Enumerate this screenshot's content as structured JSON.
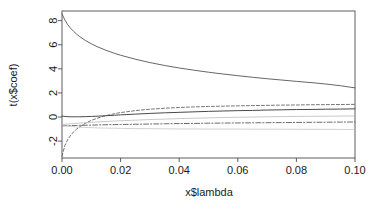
{
  "chart_data": {
    "type": "line",
    "title": "",
    "xlabel": "x$lambda",
    "ylabel": "t(x$coef)",
    "xlim": [
      0.0,
      0.1
    ],
    "ylim": [
      -3.4,
      8.8
    ],
    "grid": false,
    "legend": "none",
    "xticks": [
      "0.00",
      "0.02",
      "0.04",
      "0.06",
      "0.08",
      "0.10"
    ],
    "xtick_values": [
      0.0,
      0.02,
      0.04,
      0.06,
      0.08,
      0.1
    ],
    "yticks": [
      "8",
      "6",
      "4",
      "2",
      "0",
      "-2"
    ],
    "ytick_values": [
      8,
      6,
      4,
      2,
      0,
      -2
    ],
    "box": true,
    "x": [
      0.0,
      0.001,
      0.002,
      0.003,
      0.004,
      0.005,
      0.006,
      0.008,
      0.01,
      0.012,
      0.015,
      0.018,
      0.02,
      0.025,
      0.03,
      0.035,
      0.04,
      0.045,
      0.05,
      0.055,
      0.06,
      0.065,
      0.07,
      0.075,
      0.08,
      0.085,
      0.09,
      0.095,
      0.1
    ],
    "series": [
      {
        "name": "coef1",
        "style": "solid",
        "color": "#555555",
        "width": 0.9,
        "values": [
          8.55,
          8.05,
          7.65,
          7.35,
          7.1,
          6.88,
          6.68,
          6.35,
          6.08,
          5.84,
          5.54,
          5.28,
          5.13,
          4.8,
          4.52,
          4.28,
          4.07,
          3.89,
          3.72,
          3.57,
          3.43,
          3.3,
          3.18,
          3.07,
          2.96,
          2.86,
          2.74,
          2.6,
          2.42
        ]
      },
      {
        "name": "coef2",
        "style": "dashed",
        "color": "#666666",
        "width": 0.9,
        "values": [
          -3.25,
          -2.35,
          -1.85,
          -1.5,
          -1.22,
          -1.0,
          -0.82,
          -0.52,
          -0.28,
          -0.1,
          0.12,
          0.28,
          0.37,
          0.53,
          0.65,
          0.73,
          0.79,
          0.84,
          0.88,
          0.9,
          0.93,
          0.95,
          0.97,
          0.99,
          1.0,
          1.02,
          1.03,
          1.04,
          1.05
        ]
      },
      {
        "name": "coef3",
        "style": "solid",
        "color": "#4a4a4a",
        "width": 1.0,
        "values": [
          0.08,
          0.05,
          0.03,
          0.02,
          0.02,
          0.02,
          0.02,
          0.03,
          0.05,
          0.07,
          0.11,
          0.15,
          0.18,
          0.24,
          0.3,
          0.35,
          0.39,
          0.43,
          0.47,
          0.5,
          0.53,
          0.55,
          0.58,
          0.6,
          0.62,
          0.63,
          0.65,
          0.66,
          0.68
        ]
      },
      {
        "name": "coef4",
        "style": "solid-thin",
        "color": "#b0b0b0",
        "width": 0.7,
        "values": [
          -0.62,
          -0.6,
          -0.58,
          -0.56,
          -0.54,
          -0.52,
          -0.5,
          -0.47,
          -0.44,
          -0.41,
          -0.37,
          -0.33,
          -0.31,
          -0.26,
          -0.21,
          -0.17,
          -0.13,
          -0.1,
          -0.07,
          -0.04,
          -0.02,
          0.0,
          0.02,
          0.04,
          0.05,
          0.06,
          0.07,
          0.08,
          0.09
        ]
      },
      {
        "name": "coef5",
        "style": "dashdot",
        "color": "#5a5a5a",
        "width": 0.9,
        "values": [
          -0.72,
          -0.72,
          -0.71,
          -0.71,
          -0.7,
          -0.7,
          -0.69,
          -0.68,
          -0.67,
          -0.66,
          -0.64,
          -0.63,
          -0.62,
          -0.6,
          -0.58,
          -0.56,
          -0.54,
          -0.53,
          -0.51,
          -0.5,
          -0.49,
          -0.48,
          -0.47,
          -0.46,
          -0.45,
          -0.44,
          -0.43,
          -0.42,
          -0.41
        ]
      },
      {
        "name": "coef6",
        "style": "solid-thin",
        "color": "#bdbdbd",
        "width": 0.7,
        "values": [
          -0.7,
          -0.72,
          -0.75,
          -0.78,
          -0.8,
          -0.82,
          -0.84,
          -0.86,
          -0.88,
          -0.9,
          -0.92,
          -0.93,
          -0.94,
          -0.96,
          -0.97,
          -0.98,
          -0.99,
          -0.99,
          -1.0,
          -1.0,
          -1.0,
          -1.01,
          -1.01,
          -1.01,
          -1.02,
          -1.02,
          -1.02,
          -1.03,
          -1.03
        ]
      }
    ],
    "colors": {
      "axis": "#4d4d4d",
      "text": "#1a1a1a",
      "background": "#ffffff"
    }
  }
}
